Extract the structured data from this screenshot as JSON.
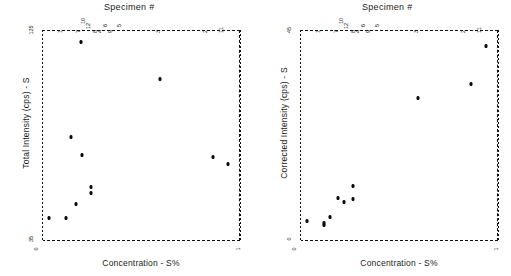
{
  "figure": {
    "panels": [
      {
        "id": "left",
        "top_title": "Specimen #",
        "xlabel": "Concentration - S%",
        "ylabel": "Total Intensity (cps) - S",
        "ytick_top": "125",
        "ytick_bottom": "35",
        "xtick_left": "0",
        "xtick_right": "1"
      },
      {
        "id": "right",
        "top_title": "Specimen #",
        "xlabel": "Concentration - S%",
        "ylabel": "Corrected Intensity (cps) - S",
        "ytick_top": "45",
        "ytick_bottom": "0",
        "xtick_left": "0",
        "xtick_right": "1"
      }
    ]
  },
  "chart_data": [
    {
      "type": "scatter",
      "title": "Specimen #",
      "xlabel": "Concentration - S%",
      "ylabel": "Total Intensity (cps) - S",
      "ylim": [
        35,
        125
      ],
      "xlim": [
        0,
        1
      ],
      "grid": false,
      "legend": "none",
      "top_axis_label": "Specimen #",
      "top_axis_ticks": [
        "1",
        "7",
        "10",
        "12",
        "8",
        "4",
        "6",
        "9",
        "5",
        "3",
        "2",
        "11"
      ],
      "points": [
        {
          "specimen": "1",
          "x": 0.035,
          "y": 45.0
        },
        {
          "specimen": "7",
          "x": 0.12,
          "y": 45.0
        },
        {
          "specimen": "10",
          "x": 0.145,
          "y": 79.5
        },
        {
          "specimen": "12",
          "x": 0.17,
          "y": 51.0
        },
        {
          "specimen": "8",
          "x": 0.195,
          "y": 120.0
        },
        {
          "specimen": "4",
          "x": 0.2,
          "y": 71.5
        },
        {
          "specimen": "6",
          "x": 0.245,
          "y": 58.0
        },
        {
          "specimen": "9",
          "x": 0.245,
          "y": 55.5
        },
        {
          "specimen": "3",
          "x": 0.595,
          "y": 104.0
        },
        {
          "specimen": "2",
          "x": 0.865,
          "y": 71.0
        },
        {
          "specimen": "11",
          "x": 0.94,
          "y": 68.0
        }
      ]
    },
    {
      "type": "scatter",
      "title": "Specimen #",
      "xlabel": "Concentration - S%",
      "ylabel": "Corrected Intensity (cps) - S",
      "ylim": [
        0,
        45
      ],
      "xlim": [
        0,
        1
      ],
      "grid": false,
      "legend": "none",
      "top_axis_label": "Specimen #",
      "top_axis_ticks": [
        "1",
        "7",
        "10",
        "12",
        "8",
        "4",
        "6",
        "9",
        "5",
        "3",
        "2",
        "11"
      ],
      "points": [
        {
          "specimen": "1",
          "x": 0.035,
          "y": 4.3
        },
        {
          "specimen": "7",
          "x": 0.12,
          "y": 3.4
        },
        {
          "specimen": "10",
          "x": 0.12,
          "y": 3.9
        },
        {
          "specimen": "12",
          "x": 0.15,
          "y": 5.2
        },
        {
          "specimen": "8",
          "x": 0.19,
          "y": 9.2
        },
        {
          "specimen": "4",
          "x": 0.22,
          "y": 8.4
        },
        {
          "specimen": "6",
          "x": 0.265,
          "y": 11.7
        },
        {
          "specimen": "9",
          "x": 0.265,
          "y": 9.0
        },
        {
          "specimen": "3",
          "x": 0.595,
          "y": 30.5
        },
        {
          "specimen": "2",
          "x": 0.865,
          "y": 33.5
        },
        {
          "specimen": "11",
          "x": 0.94,
          "y": 41.5
        }
      ]
    }
  ]
}
